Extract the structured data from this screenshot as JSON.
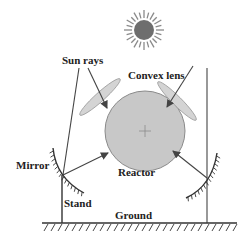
{
  "diagram": {
    "labels": {
      "sun_rays": "Sun rays",
      "convex_lens": "Convex lens",
      "mirror": "Mirror",
      "reactor": "Reactor",
      "stand": "Stand",
      "ground": "Ground"
    },
    "colors": {
      "line": "#333333",
      "sun_core": "#6e6e6e",
      "sun_rays": "#8a8a8a",
      "reactor_fill": "#c8c8c8",
      "reactor_stroke": "#8a8a8a",
      "lens_fill": "#d4d4d4",
      "lens_stroke": "#9a9a9a"
    }
  }
}
